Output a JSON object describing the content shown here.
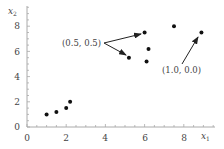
{
  "chart_data": {
    "type": "scatter",
    "title": "",
    "xlabel": "x1",
    "ylabel": "x2",
    "xlim": [
      0,
      9.5
    ],
    "ylim": [
      0,
      9.5
    ],
    "xticks": [
      0,
      2,
      4,
      6,
      8
    ],
    "yticks": [
      0,
      2,
      4,
      6,
      8
    ],
    "grid": false,
    "legend": null,
    "points": [
      {
        "x": 1.0,
        "y": 1.0
      },
      {
        "x": 1.5,
        "y": 1.2
      },
      {
        "x": 2.0,
        "y": 1.5
      },
      {
        "x": 2.2,
        "y": 2.0
      },
      {
        "x": 5.2,
        "y": 5.5
      },
      {
        "x": 6.0,
        "y": 7.5
      },
      {
        "x": 6.2,
        "y": 6.2
      },
      {
        "x": 6.1,
        "y": 5.2
      },
      {
        "x": 7.5,
        "y": 8.0
      },
      {
        "x": 8.9,
        "y": 7.5
      }
    ],
    "annotations": [
      {
        "text": "(0.5, 0.5)",
        "targets": [
          {
            "x": 6.0,
            "y": 7.5
          },
          {
            "x": 5.2,
            "y": 5.5
          }
        ]
      },
      {
        "text": "(1.0, 0.0)",
        "targets": [
          {
            "x": 8.9,
            "y": 7.5
          }
        ]
      }
    ]
  },
  "labels": {
    "x_axis": "x",
    "x_axis_sub": "1",
    "y_axis": "x",
    "y_axis_sub": "2",
    "annot_a": "(0.5, 0.5)",
    "annot_b": "(1.0, 0.0)",
    "ticks_x": [
      "0",
      "2",
      "4",
      "6",
      "8"
    ],
    "ticks_y": [
      "0",
      "2",
      "4",
      "6",
      "8"
    ]
  }
}
